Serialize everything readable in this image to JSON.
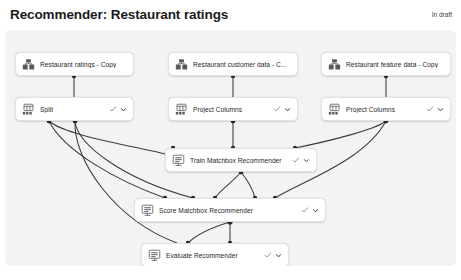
{
  "header": {
    "title": "Recommender: Restaurant ratings",
    "status": "In draft"
  },
  "canvas": {
    "background_color": "#f3f3f3",
    "node_background_color": "#ffffff",
    "edge_color": "#3b3b3b"
  },
  "icons": {
    "dataset": "dataset-icon",
    "module": "module-icon",
    "model": "model-icon",
    "check": "check-icon",
    "chevron_down": "chevron-down-icon"
  },
  "nodes": [
    {
      "id": "restaurant-ratings-copy",
      "label": "Restaurant ratings - Copy",
      "icon": "dataset",
      "x": 10,
      "y": 22,
      "w": 119,
      "actions": false
    },
    {
      "id": "restaurant-customer-data",
      "label": "Restaurant customer data  - C...",
      "icon": "dataset",
      "x": 163,
      "y": 22,
      "w": 130,
      "actions": false
    },
    {
      "id": "restaurant-feature-data-copy",
      "label": "Restaurant feature data  - Copy",
      "icon": "dataset",
      "x": 316,
      "y": 22,
      "w": 130,
      "actions": false
    },
    {
      "id": "split",
      "label": "Split",
      "icon": "module",
      "x": 10,
      "y": 67,
      "w": 119,
      "actions": true
    },
    {
      "id": "project-columns-1",
      "label": "Project Columns",
      "icon": "module",
      "x": 163,
      "y": 67,
      "w": 130,
      "actions": true
    },
    {
      "id": "project-columns-2",
      "label": "Project Columns",
      "icon": "module",
      "x": 316,
      "y": 67,
      "w": 130,
      "actions": true
    },
    {
      "id": "train-matchbox-recommender",
      "label": "Train Matchbox Recommender",
      "icon": "model",
      "x": 160,
      "y": 118,
      "w": 152,
      "actions": true
    },
    {
      "id": "score-matchbox-recommender",
      "label": "Score Matchbox Recommender",
      "icon": "model",
      "x": 129,
      "y": 168,
      "w": 192,
      "actions": true
    },
    {
      "id": "evaluate-recommender",
      "label": "Evaluate Recommender",
      "icon": "model",
      "x": 136,
      "y": 213,
      "w": 148,
      "actions": true
    }
  ],
  "chart_data": {
    "type": "diagram",
    "title": "Recommender: Restaurant ratings",
    "node_labels": [
      "Restaurant ratings - Copy",
      "Restaurant customer data  - C...",
      "Restaurant feature data  - Copy",
      "Split",
      "Project Columns",
      "Project Columns",
      "Train Matchbox Recommender",
      "Score Matchbox Recommender",
      "Evaluate Recommender"
    ],
    "edges": [
      {
        "from": "restaurant-ratings-copy",
        "to": "split"
      },
      {
        "from": "restaurant-customer-data",
        "to": "project-columns-1"
      },
      {
        "from": "restaurant-feature-data-copy",
        "to": "project-columns-2"
      },
      {
        "from": "split",
        "to": "train-matchbox-recommender"
      },
      {
        "from": "split",
        "to": "score-matchbox-recommender"
      },
      {
        "from": "split",
        "to": "evaluate-recommender"
      },
      {
        "from": "project-columns-1",
        "to": "train-matchbox-recommender"
      },
      {
        "from": "project-columns-2",
        "to": "train-matchbox-recommender"
      },
      {
        "from": "project-columns-2",
        "to": "score-matchbox-recommender"
      },
      {
        "from": "train-matchbox-recommender",
        "to": "score-matchbox-recommender"
      },
      {
        "from": "score-matchbox-recommender",
        "to": "evaluate-recommender"
      }
    ]
  }
}
